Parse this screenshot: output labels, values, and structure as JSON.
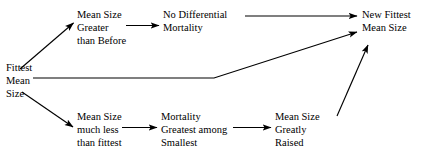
{
  "diagram": {
    "type": "flowchart",
    "title": "",
    "background_color": "#ffffff",
    "text_color": "#000000",
    "nodes": [
      {
        "id": "fittest-mean-size",
        "lines": [
          "Fittest",
          "Mean",
          "Size"
        ],
        "role": "start"
      },
      {
        "id": "mean-size-greater",
        "lines": [
          "Mean Size",
          "Greater",
          "than Before"
        ],
        "role": "branch-upper"
      },
      {
        "id": "no-differential-mortality",
        "lines": [
          "No Differential",
          "Mortality"
        ],
        "role": "branch-upper"
      },
      {
        "id": "new-fittest-mean-size",
        "lines": [
          "New Fittest",
          "Mean Size"
        ],
        "role": "end"
      },
      {
        "id": "mean-size-much-less",
        "lines": [
          "Mean Size",
          "much less",
          "than fittest"
        ],
        "role": "branch-lower"
      },
      {
        "id": "mortality-greatest-among-smallest",
        "lines": [
          "Mortality",
          "Greatest among",
          "Smallest"
        ],
        "role": "branch-lower"
      },
      {
        "id": "mean-size-greatly-raised",
        "lines": [
          "Mean Size",
          "Greatly",
          "Raised"
        ],
        "role": "branch-lower"
      }
    ],
    "edges": [
      {
        "id": "edge-start-to-greater",
        "from": "fittest-mean-size",
        "to": "mean-size-greater",
        "style": "diagonal-up"
      },
      {
        "id": "edge-greater-to-nodifferential",
        "from": "mean-size-greater",
        "to": "no-differential-mortality",
        "style": "horizontal"
      },
      {
        "id": "edge-nodifferential-to-new",
        "from": "no-differential-mortality",
        "to": "new-fittest-mean-size",
        "style": "horizontal-long"
      },
      {
        "id": "edge-start-to-new-direct",
        "from": "fittest-mean-size",
        "to": "new-fittest-mean-size",
        "style": "horizontal-then-up"
      },
      {
        "id": "edge-start-to-less",
        "from": "fittest-mean-size",
        "to": "mean-size-much-less",
        "style": "diagonal-down"
      },
      {
        "id": "edge-less-to-mortality",
        "from": "mean-size-much-less",
        "to": "mortality-greatest-among-smallest",
        "style": "horizontal"
      },
      {
        "id": "edge-mortality-to-raised",
        "from": "mortality-greatest-among-smallest",
        "to": "mean-size-greatly-raised",
        "style": "horizontal"
      },
      {
        "id": "edge-raised-to-new",
        "from": "mean-size-greatly-raised",
        "to": "new-fittest-mean-size",
        "style": "diagonal-up-steep"
      }
    ]
  }
}
